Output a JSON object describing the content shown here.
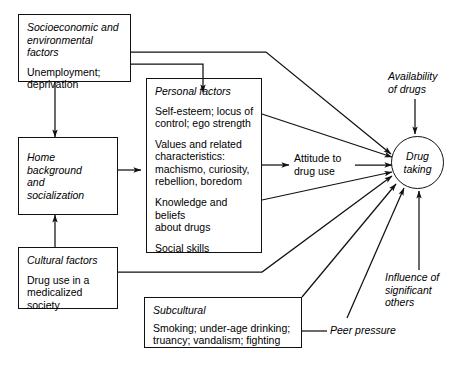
{
  "diagram": {
    "boxes": [
      {
        "id": "socioeconomic",
        "title": "Socioeconomic and\nenvironmental factors",
        "body": [
          "Unemployment;\ndeprivation"
        ]
      },
      {
        "id": "home",
        "title": "Home background\nand\nsocialization",
        "body": []
      },
      {
        "id": "cultural",
        "title": "Cultural factors",
        "body": [
          "Drug use in a\nmedicalized\nsociety"
        ]
      },
      {
        "id": "personal",
        "title": "Personal factors",
        "body": [
          "Self-esteem; locus of\ncontrol; ego strength",
          "Values and related\ncharacteristics:\nmachismo, curiosity,\nrebellion, boredom",
          "Knowledge and beliefs\nabout drugs",
          "Social skills"
        ]
      },
      {
        "id": "subcultural",
        "title": "Subcultural",
        "body": [
          "Smoking; under-age drinking;\ntruancy; vandalism; fighting"
        ]
      }
    ],
    "labels": [
      {
        "id": "attitude",
        "text": "Attitude to\ndrug use",
        "italic": false
      },
      {
        "id": "availability",
        "text": "Availability\nof drugs",
        "italic": true
      },
      {
        "id": "influence",
        "text": "Influence of\nsignificant\nothers",
        "italic": true
      },
      {
        "id": "peer",
        "text": "Peer pressure",
        "italic": true
      }
    ],
    "outcome": {
      "id": "drug-taking",
      "text": "Drug\ntaking"
    },
    "colors": {
      "stroke": "#111111",
      "text": "#000000",
      "background": "#ffffff"
    }
  }
}
